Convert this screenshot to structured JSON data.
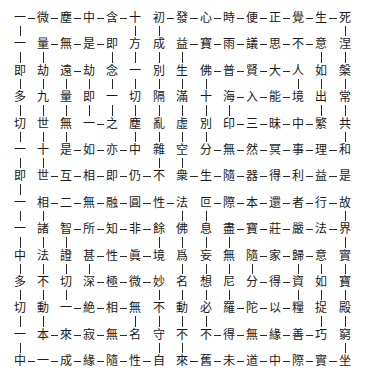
{
  "grid": {
    "cols": 15,
    "rows": 14,
    "x": [
      20,
      43,
      66,
      89,
      112,
      135,
      159,
      182,
      206,
      229,
      252,
      275,
      298,
      321,
      345
    ],
    "y0": 18,
    "dy": 26.4,
    "chars": [
      [
        "一",
        "微",
        "塵",
        "中",
        "含",
        "十",
        "初",
        "發",
        "心",
        "時",
        "便",
        "正",
        "覺",
        "生",
        "死"
      ],
      [
        "一",
        "量",
        "無",
        "是",
        "即",
        "方",
        "成",
        "益",
        "寶",
        "雨",
        "議",
        "思",
        "不",
        "意",
        "涅"
      ],
      [
        "即",
        "劫",
        "遠",
        "劫",
        "念",
        "一",
        "別",
        "生",
        "佛",
        "普",
        "賢",
        "大",
        "人",
        "如",
        "槃"
      ],
      [
        "多",
        "九",
        "量",
        "即",
        "一",
        "切",
        "隔",
        "滿",
        "十",
        "海",
        "入",
        "能",
        "境",
        "出",
        "常"
      ],
      [
        "切",
        "世",
        "無",
        "一",
        "之",
        "塵",
        "亂",
        "虛",
        "別",
        "印",
        "三",
        "昧",
        "中",
        "繁",
        "共"
      ],
      [
        "一",
        "十",
        "是",
        "如",
        "亦",
        "中",
        "雜",
        "空",
        "分",
        "無",
        "然",
        "冥",
        "事",
        "理",
        "和"
      ],
      [
        "即",
        "世",
        "互",
        "相",
        "即",
        "仍",
        "不",
        "衆",
        "生",
        "隨",
        "器",
        "得",
        "利",
        "益",
        "是"
      ],
      [
        "一",
        "相",
        "二",
        "無",
        "融",
        "圓",
        "性",
        "法",
        "叵",
        "際",
        "本",
        "還",
        "者",
        "行",
        "故"
      ],
      [
        "一",
        "諸",
        "智",
        "所",
        "知",
        "非",
        "餘",
        "佛",
        "息",
        "盡",
        "寶",
        "莊",
        "嚴",
        "法",
        "界"
      ],
      [
        "中",
        "法",
        "證",
        "甚",
        "性",
        "眞",
        "境",
        "爲",
        "妄",
        "無",
        "隨",
        "家",
        "歸",
        "意",
        "實"
      ],
      [
        "多",
        "不",
        "切",
        "深",
        "極",
        "微",
        "妙",
        "名",
        "想",
        "尼",
        "分",
        "得",
        "資",
        "如",
        "寶"
      ],
      [
        "切",
        "動",
        "一",
        "絶",
        "相",
        "無",
        "不",
        "動",
        "必",
        "羅",
        "陀",
        "以",
        "糧",
        "捉",
        "殿"
      ],
      [
        "一",
        "本",
        "來",
        "寂",
        "無",
        "名",
        "守",
        "不",
        "不",
        "得",
        "無",
        "緣",
        "善",
        "巧",
        "窮"
      ],
      [
        "中",
        "一",
        "成",
        "緣",
        "隨",
        "性",
        "自",
        "來",
        "舊",
        "未",
        "道",
        "中",
        "際",
        "實",
        "坐"
      ]
    ],
    "h_links": [
      [
        0,
        0
      ],
      [
        0,
        1
      ],
      [
        0,
        2
      ],
      [
        0,
        3
      ],
      [
        0,
        4
      ],
      [
        0,
        6
      ],
      [
        0,
        7
      ],
      [
        0,
        8
      ],
      [
        0,
        9
      ],
      [
        0,
        10
      ],
      [
        0,
        11
      ],
      [
        0,
        12
      ],
      [
        0,
        13
      ],
      [
        1,
        1
      ],
      [
        1,
        2
      ],
      [
        1,
        3
      ],
      [
        1,
        7
      ],
      [
        1,
        8
      ],
      [
        1,
        9
      ],
      [
        1,
        10
      ],
      [
        1,
        11
      ],
      [
        1,
        12
      ],
      [
        2,
        2
      ],
      [
        2,
        8
      ],
      [
        2,
        9
      ],
      [
        2,
        10
      ],
      [
        2,
        11
      ],
      [
        3,
        9
      ],
      [
        3,
        10
      ],
      [
        3,
        11
      ],
      [
        4,
        3
      ],
      [
        4,
        9
      ],
      [
        4,
        10
      ],
      [
        4,
        11
      ],
      [
        4,
        12
      ],
      [
        5,
        2
      ],
      [
        5,
        3
      ],
      [
        5,
        4
      ],
      [
        5,
        8
      ],
      [
        5,
        9
      ],
      [
        5,
        10
      ],
      [
        5,
        11
      ],
      [
        5,
        12
      ],
      [
        5,
        13
      ],
      [
        6,
        1
      ],
      [
        6,
        2
      ],
      [
        6,
        3
      ],
      [
        6,
        4
      ],
      [
        6,
        5
      ],
      [
        6,
        7
      ],
      [
        6,
        8
      ],
      [
        6,
        9
      ],
      [
        6,
        10
      ],
      [
        6,
        11
      ],
      [
        6,
        12
      ],
      [
        6,
        13
      ],
      [
        7,
        1
      ],
      [
        7,
        2
      ],
      [
        7,
        3
      ],
      [
        7,
        4
      ],
      [
        7,
        5
      ],
      [
        7,
        6
      ],
      [
        7,
        8
      ],
      [
        7,
        9
      ],
      [
        7,
        10
      ],
      [
        7,
        11
      ],
      [
        7,
        12
      ],
      [
        7,
        13
      ],
      [
        8,
        2
      ],
      [
        8,
        3
      ],
      [
        8,
        4
      ],
      [
        8,
        5
      ],
      [
        8,
        9
      ],
      [
        8,
        10
      ],
      [
        8,
        11
      ],
      [
        8,
        12
      ],
      [
        8,
        13
      ],
      [
        9,
        3
      ],
      [
        9,
        4
      ],
      [
        9,
        5
      ],
      [
        9,
        10
      ],
      [
        9,
        11
      ],
      [
        9,
        12
      ],
      [
        10,
        3
      ],
      [
        10,
        4
      ],
      [
        10,
        5
      ],
      [
        10,
        10
      ],
      [
        10,
        11
      ],
      [
        11,
        2
      ],
      [
        11,
        3
      ],
      [
        11,
        4
      ],
      [
        11,
        9
      ],
      [
        11,
        10
      ],
      [
        11,
        11
      ],
      [
        12,
        1
      ],
      [
        12,
        2
      ],
      [
        12,
        3
      ],
      [
        12,
        4
      ],
      [
        12,
        8
      ],
      [
        12,
        9
      ],
      [
        12,
        10
      ],
      [
        12,
        11
      ],
      [
        12,
        12
      ],
      [
        13,
        0
      ],
      [
        13,
        1
      ],
      [
        13,
        2
      ],
      [
        13,
        3
      ],
      [
        13,
        4
      ],
      [
        13,
        5
      ],
      [
        13,
        7
      ],
      [
        13,
        8
      ],
      [
        13,
        9
      ],
      [
        13,
        10
      ],
      [
        13,
        11
      ],
      [
        13,
        12
      ],
      [
        13,
        13
      ]
    ],
    "v_links": [
      [
        0,
        0
      ],
      [
        0,
        5
      ],
      [
        0,
        6
      ],
      [
        0,
        14
      ],
      [
        1,
        0
      ],
      [
        1,
        1
      ],
      [
        1,
        4
      ],
      [
        1,
        5
      ],
      [
        1,
        6
      ],
      [
        1,
        7
      ],
      [
        1,
        13
      ],
      [
        1,
        14
      ],
      [
        2,
        0
      ],
      [
        2,
        1
      ],
      [
        2,
        2
      ],
      [
        2,
        3
      ],
      [
        2,
        4
      ],
      [
        2,
        5
      ],
      [
        2,
        6
      ],
      [
        2,
        7
      ],
      [
        2,
        8
      ],
      [
        2,
        12
      ],
      [
        2,
        13
      ],
      [
        2,
        14
      ],
      [
        3,
        0
      ],
      [
        3,
        1
      ],
      [
        3,
        2
      ],
      [
        3,
        3
      ],
      [
        3,
        4
      ],
      [
        3,
        5
      ],
      [
        3,
        6
      ],
      [
        3,
        7
      ],
      [
        3,
        8
      ],
      [
        3,
        9
      ],
      [
        3,
        13
      ],
      [
        3,
        14
      ],
      [
        4,
        0
      ],
      [
        4,
        1
      ],
      [
        4,
        2
      ],
      [
        4,
        5
      ],
      [
        4,
        6
      ],
      [
        4,
        7
      ],
      [
        4,
        8
      ],
      [
        4,
        14
      ],
      [
        5,
        0
      ],
      [
        5,
        1
      ],
      [
        5,
        6
      ],
      [
        5,
        7
      ],
      [
        6,
        0
      ],
      [
        7,
        0
      ],
      [
        7,
        1
      ],
      [
        7,
        7
      ],
      [
        7,
        8
      ],
      [
        7,
        14
      ],
      [
        8,
        0
      ],
      [
        8,
        1
      ],
      [
        8,
        2
      ],
      [
        8,
        6
      ],
      [
        8,
        7
      ],
      [
        8,
        8
      ],
      [
        8,
        9
      ],
      [
        8,
        14
      ],
      [
        9,
        0
      ],
      [
        9,
        1
      ],
      [
        9,
        2
      ],
      [
        9,
        3
      ],
      [
        9,
        7
      ],
      [
        9,
        8
      ],
      [
        9,
        9
      ],
      [
        9,
        10
      ],
      [
        9,
        12
      ],
      [
        9,
        13
      ],
      [
        9,
        14
      ],
      [
        10,
        0
      ],
      [
        10,
        1
      ],
      [
        10,
        2
      ],
      [
        10,
        6
      ],
      [
        10,
        7
      ],
      [
        10,
        8
      ],
      [
        10,
        9
      ],
      [
        10,
        12
      ],
      [
        10,
        13
      ],
      [
        10,
        14
      ],
      [
        11,
        0
      ],
      [
        11,
        1
      ],
      [
        11,
        5
      ],
      [
        11,
        6
      ],
      [
        11,
        7
      ],
      [
        11,
        8
      ],
      [
        11,
        13
      ],
      [
        11,
        14
      ],
      [
        12,
        0
      ],
      [
        12,
        6
      ],
      [
        12,
        7
      ],
      [
        12,
        14
      ]
    ]
  },
  "colors": {
    "ink": "#1a1a1a",
    "line": "#2a2a2a",
    "paper": "#ffffff"
  }
}
